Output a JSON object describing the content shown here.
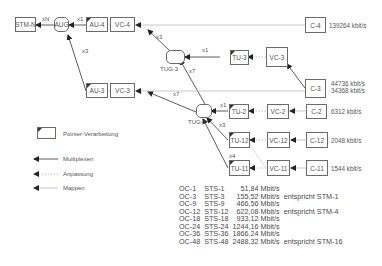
{
  "nodes": {
    "stm_n": "STM-N",
    "aug": "AUG",
    "au4": "AU-4",
    "au3": "AU-3",
    "vc4": "VC-4",
    "vc3_left": "VC-3",
    "tug3": "TUG-3",
    "tu3": "TU-3",
    "vc3_right": "VC-3",
    "c4": "C-4",
    "c3": "C-3",
    "tug2": "TUG-2",
    "tu2": "TU-2",
    "tu12": "TU-12",
    "tu11": "TU-11",
    "vc2": "VC-2",
    "vc12": "VC-12",
    "vc11": "VC-11",
    "c2": "C-2",
    "c12": "C-12",
    "c11": "C-11"
  },
  "multipliers": {
    "aug_to_stm": "xN",
    "au4_to_aug": "x1",
    "au3_to_aug": "x3",
    "tug3_to_vc4": "x3",
    "tu3_to_tug3": "x1",
    "tug2_to_tug3": "x7",
    "tug2_to_vc3": "x7",
    "tu2_to_tug2": "x1",
    "tu12_to_tug2": "x3",
    "tu11_to_tug2": "x4"
  },
  "rates": {
    "c4": "139264 kbit/s",
    "c3_a": "44736 kbit/s",
    "c3_b": "34368 kbit/s",
    "c2": "6312 kbit/s",
    "c12": "2048 kbit/s",
    "c11": "1544 kbit/s"
  },
  "legend": {
    "pointer": "Pointer-Verarbeitung",
    "multiplex": "Multiplexen",
    "adapt": "Anpassung",
    "map": "Mappen"
  },
  "oc_table": [
    {
      "oc": "OC-1",
      "sts": "STS-1",
      "rate": "51,84 Mbit/s",
      "note": ""
    },
    {
      "oc": "OC-3",
      "sts": "STS-3",
      "rate": "155,52 Mbit/s",
      "note": "entspricht STM-1"
    },
    {
      "oc": "OC-9",
      "sts": "STS-9",
      "rate": "466,56 Mbit/s",
      "note": ""
    },
    {
      "oc": "OC-12",
      "sts": "STS-12",
      "rate": "622,08 Mbit/s",
      "note": "entspricht STM-4"
    },
    {
      "oc": "OC-18",
      "sts": "STS-18",
      "rate": "933,12 Mbit/s",
      "note": ""
    },
    {
      "oc": "OC-24",
      "sts": "STS-24",
      "rate": "1244,16 Mbit/s",
      "note": ""
    },
    {
      "oc": "OC-36",
      "sts": "STS-36",
      "rate": "1866,24 Mbit/s",
      "note": ""
    },
    {
      "oc": "OC-48",
      "sts": "STS-48",
      "rate": "2488,32 Mbit/s",
      "note": "entspricht STM-16"
    }
  ],
  "colors": {
    "line_dark": "#333333",
    "line_light": "#bbbbbb",
    "box_border": "#6a6a6a",
    "text": "#4a4a4a"
  }
}
